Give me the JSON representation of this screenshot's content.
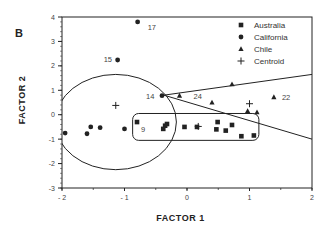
{
  "chart_data": {
    "type": "scatter",
    "panel_label": "B",
    "title": "",
    "xlabel": "FACTOR 1",
    "ylabel": "FACTOR 2",
    "xlim": [
      -2,
      2
    ],
    "ylim": [
      -3,
      4
    ],
    "xticks": [
      -2,
      -1,
      0,
      1,
      2
    ],
    "yticks": [
      -3,
      -2,
      -1,
      0,
      1,
      2,
      3,
      4
    ],
    "grid": false,
    "legend_position": "upper right",
    "legend": [
      {
        "name": "Australia",
        "marker": "square"
      },
      {
        "name": "California",
        "marker": "circle"
      },
      {
        "name": "Chile",
        "marker": "triangle"
      },
      {
        "name": "Centroid",
        "marker": "plus"
      }
    ],
    "series": [
      {
        "name": "Australia",
        "marker": "square",
        "points": [
          {
            "x": -0.8,
            "y": -0.3
          },
          {
            "x": -0.35,
            "y": -0.45
          },
          {
            "x": -0.32,
            "y": -0.38
          },
          {
            "x": -0.38,
            "y": -0.58
          },
          {
            "x": -0.04,
            "y": -0.5
          },
          {
            "x": 0.16,
            "y": -0.5
          },
          {
            "x": 0.49,
            "y": -0.3
          },
          {
            "x": 0.47,
            "y": -0.6
          },
          {
            "x": 0.62,
            "y": -0.65
          },
          {
            "x": 0.72,
            "y": -0.42
          },
          {
            "x": 0.87,
            "y": -0.88
          },
          {
            "x": 1.07,
            "y": -0.85
          }
        ]
      },
      {
        "name": "California",
        "marker": "circle",
        "points": [
          {
            "x": -0.79,
            "y": 3.8,
            "label": "17"
          },
          {
            "x": -1.11,
            "y": 2.24,
            "label": "15"
          },
          {
            "x": -0.4,
            "y": 0.78,
            "label": "14"
          },
          {
            "x": -1.95,
            "y": -0.75
          },
          {
            "x": -1.6,
            "y": -0.78
          },
          {
            "x": -1.54,
            "y": -0.5
          },
          {
            "x": -1.39,
            "y": -0.53
          },
          {
            "x": -1.0,
            "y": -0.58
          }
        ]
      },
      {
        "name": "Chile",
        "marker": "triangle",
        "points": [
          {
            "x": -0.12,
            "y": 0.78,
            "label": "24"
          },
          {
            "x": 0.72,
            "y": 1.25
          },
          {
            "x": 0.4,
            "y": 0.5
          },
          {
            "x": 1.39,
            "y": 0.72,
            "label": "22"
          },
          {
            "x": 0.97,
            "y": 0.15
          },
          {
            "x": 1.12,
            "y": 0.1
          }
        ]
      },
      {
        "name": "Centroid",
        "marker": "plus",
        "points": [
          {
            "x": -1.14,
            "y": 0.38
          },
          {
            "x": 0.18,
            "y": -0.48
          },
          {
            "x": 1.0,
            "y": 0.45
          }
        ]
      }
    ],
    "annotations": [
      {
        "text": "17",
        "x": -0.79,
        "y": 3.8
      },
      {
        "text": "15",
        "x": -1.11,
        "y": 2.24
      },
      {
        "text": "14",
        "x": -0.4,
        "y": 0.78
      },
      {
        "text": "24",
        "x": -0.12,
        "y": 0.78
      },
      {
        "text": "22",
        "x": 1.39,
        "y": 0.72
      },
      {
        "text": "9",
        "x": -0.8,
        "y": -0.3
      }
    ],
    "shapes": [
      {
        "type": "ellipse",
        "group": "California",
        "cx": -1.14,
        "cy": -0.3,
        "rx": 0.97,
        "ry": 1.95
      },
      {
        "type": "rounded-rect",
        "group": "Australia",
        "x0": -0.87,
        "x1": 1.15,
        "y0": -1.05,
        "y1": 0.05
      },
      {
        "type": "wedge",
        "group": "Chile",
        "apex": [
          -0.37,
          0.8
        ],
        "upper_end": [
          2.0,
          1.65
        ],
        "lower_end": [
          2.0,
          -1.0
        ]
      }
    ]
  }
}
